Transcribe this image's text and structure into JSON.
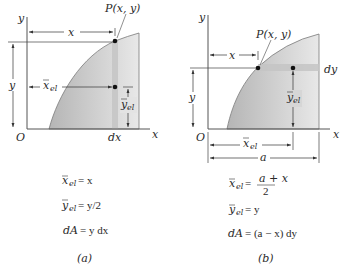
{
  "figure": {
    "colors": {
      "region_fill_light": "#e6e6e6",
      "region_fill_dark": "#b9b9b9",
      "strip_fill": "#c9c9c9",
      "curve": "#7a7a7a",
      "ink": "#2a2a2a"
    },
    "panel_a": {
      "axis_y": "y",
      "axis_x": "x",
      "origin": "O",
      "point_label": "P(x, y)",
      "dim_x": "x",
      "dim_y": "y",
      "xbar_main": "x",
      "xbar_sub": "el",
      "ybar_main": "y",
      "ybar_sub": "el",
      "strip_label": "dx",
      "equations": [
        {
          "lhs_main": "x",
          "lhs_sub": "el",
          "rhs": "= x"
        },
        {
          "lhs_main": "y",
          "lhs_sub": "el",
          "rhs": "= y/2"
        },
        {
          "lhs_main": "dA",
          "lhs_sub": "",
          "rhs": "= y dx"
        }
      ],
      "caption": "(a)"
    },
    "panel_b": {
      "axis_y": "y",
      "axis_x": "x",
      "origin": "O",
      "point_label": "P(x, y)",
      "dim_x": "x",
      "dim_y": "y",
      "xbar_main": "x",
      "xbar_sub": "el",
      "ybar_main": "y",
      "ybar_sub": "el",
      "dim_a": "a",
      "strip_label": "dy",
      "equations": [
        {
          "lhs_main": "x",
          "lhs_sub": "el",
          "rhs_prefix": "=",
          "numerator": "a + x",
          "denominator": "2"
        },
        {
          "lhs_main": "y",
          "lhs_sub": "el",
          "rhs": "= y"
        },
        {
          "lhs_main": "dA",
          "lhs_sub": "",
          "rhs": "= (a − x) dy"
        }
      ],
      "caption": "(b)"
    }
  }
}
